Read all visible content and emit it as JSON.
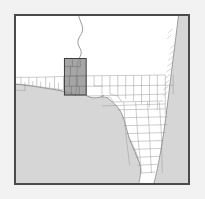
{
  "figure": {
    "type": "locator-map",
    "title": "",
    "caption": "",
    "frame": {
      "border_color": "#4a4a4a",
      "background_color": "#f2f2f2",
      "land_color": "#ffffff",
      "water_color": "#d6d6d6",
      "boundary_color": "#9a9a9a",
      "river_color": "#8d8d8d",
      "study_area_fill": "#8c8c8c",
      "study_area_stroke": "#3a3a3a"
    },
    "extent": {
      "x_min": 0,
      "y_min": 0,
      "x_max": 176,
      "y_max": 171,
      "units": "map-frame-pixels"
    }
  },
  "map_data": {
    "type": "map",
    "layers": [
      {
        "name": "water",
        "label": "Gulf of Mexico and Atlantic Ocean",
        "fill": "#d6d6d6",
        "interactable": false
      },
      {
        "name": "land",
        "label": "Land",
        "fill": "#ffffff",
        "interactable": false
      },
      {
        "name": "county-boundaries",
        "label": "County boundaries",
        "stroke": "#9a9a9a",
        "stroke_width": 0.5,
        "interactable": false
      },
      {
        "name": "river",
        "label": "River",
        "stroke": "#8d8d8d",
        "stroke_width": 0.8,
        "interactable": false
      },
      {
        "name": "study-area",
        "label": "Study area",
        "fill": "#8c8c8c",
        "stroke": "#3a3a3a",
        "opacity": 0.75,
        "interactable": true
      }
    ],
    "study_area_box": {
      "x": 50,
      "y": 44,
      "width": 22,
      "height": 37,
      "units": "map-frame-pixels"
    },
    "annotations": [],
    "labels": [],
    "legend": {
      "visible": false,
      "entries": []
    },
    "scalebar": {
      "visible": false,
      "text": ""
    },
    "north_arrow": {
      "visible": false,
      "text": ""
    }
  }
}
